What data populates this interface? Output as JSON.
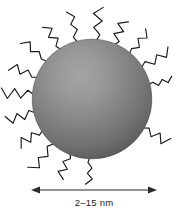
{
  "figure": {
    "kind": "nanoparticle-schematic",
    "background_color": "#ffffff",
    "width": 187,
    "height": 213
  },
  "core": {
    "label": "nanoparticle-core",
    "shape": "sphere",
    "center_x": 92,
    "center_y": 99,
    "radius": 60,
    "highlight_color": "#a0a0a0",
    "mid_color": "#757575",
    "edge_color": "#4a4a4a",
    "highlight_cx": 78,
    "highlight_cy": 72
  },
  "ligands": {
    "label": "surface-ligand-shell",
    "count": 16,
    "stroke_color": "#1a1a1a",
    "segment_count": 5,
    "angles_deg": [
      268,
      248,
      230,
      212,
      194,
      176,
      158,
      140,
      122,
      104,
      86,
      68,
      50,
      32,
      14,
      330
    ],
    "inner_offset": -2,
    "length": 30,
    "zigzag_amplitude": 4.2
  },
  "scale_bar": {
    "label": "size-scale-bar",
    "value_text": "2–15 nm",
    "min_nm": 2,
    "max_nm": 15,
    "unit": "nm",
    "arrow_y": 190,
    "arrow_x_start": 31,
    "arrow_x_end": 157,
    "arrow_color": "#2b2b2b",
    "label_x": 94,
    "label_y": 206
  }
}
